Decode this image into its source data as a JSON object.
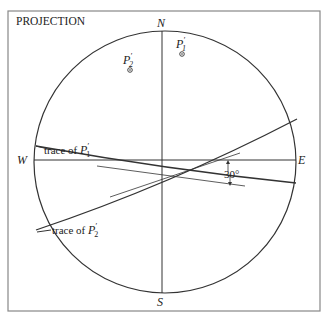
{
  "diagram": {
    "title": "PROJECTION",
    "compass": {
      "north": "N",
      "south": "S",
      "west": "W",
      "east": "E"
    },
    "points": [
      {
        "id": "P2",
        "label_main": "P",
        "label_sub": "2",
        "label_prime": "′"
      },
      {
        "id": "P1",
        "label_main": "P",
        "label_sub": "1",
        "label_prime": "′"
      }
    ],
    "traces": [
      {
        "text": "trace of ",
        "label_main": "P",
        "label_sub": "1",
        "label_prime": "′"
      },
      {
        "text": "trace of ",
        "label_main": "P",
        "label_sub": "2",
        "label_prime": "′"
      }
    ],
    "angle_label": "30°",
    "colors": {
      "line": "#333333",
      "frame": "#888888",
      "background": "#ffffff"
    }
  }
}
